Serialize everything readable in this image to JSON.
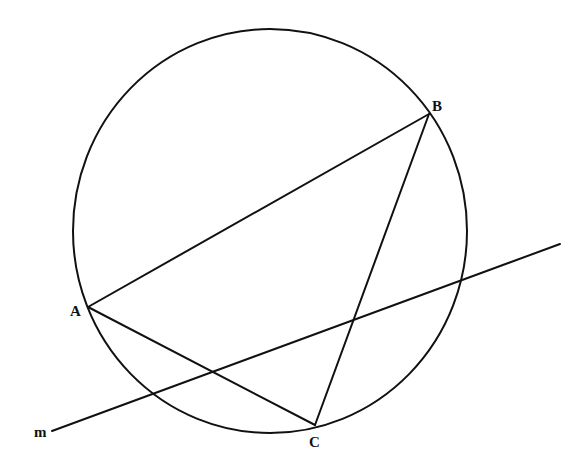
{
  "diagram": {
    "type": "geometry-figure",
    "stroke_color": "#111111",
    "background": "#ffffff",
    "circle": {
      "cx": 270,
      "cy": 231,
      "rx": 197,
      "ry": 202
    },
    "points": {
      "A": {
        "label": "A",
        "x": 88,
        "y": 307,
        "label_x": 70,
        "label_y": 316
      },
      "B": {
        "label": "B",
        "x": 429,
        "y": 114,
        "label_x": 432,
        "label_y": 111
      },
      "C": {
        "label": "C",
        "x": 315,
        "y": 425,
        "label_x": 309,
        "label_y": 447
      }
    },
    "segments": [
      {
        "name": "AB",
        "from": "A",
        "to": "B"
      },
      {
        "name": "BC",
        "from": "B",
        "to": "C"
      },
      {
        "name": "AC",
        "from": "A",
        "to": "C"
      }
    ],
    "line_m": {
      "label": "m",
      "x1": 52,
      "y1": 431,
      "x2": 560,
      "y2": 244,
      "label_x": 34,
      "label_y": 437
    }
  }
}
